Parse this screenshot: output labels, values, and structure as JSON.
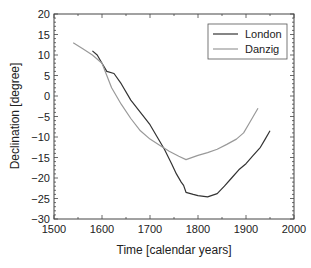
{
  "chart_data": {
    "type": "line",
    "title": "",
    "xlabel": "Time [calendar years]",
    "ylabel": "Declination [degree]",
    "xlim": [
      1500,
      2000
    ],
    "ylim": [
      -30,
      20
    ],
    "xticks": [
      1500,
      1600,
      1700,
      1800,
      1900,
      2000
    ],
    "yticks": [
      20,
      15,
      10,
      5,
      0,
      -5,
      -10,
      -15,
      -20,
      -25,
      -30
    ],
    "grid": false,
    "legend_position": "upper right",
    "series": [
      {
        "name": "London",
        "color": "#333333",
        "x": [
          1580,
          1590,
          1600,
          1610,
          1625,
          1640,
          1660,
          1680,
          1700,
          1715,
          1730,
          1745,
          1755,
          1765,
          1770,
          1775,
          1790,
          1800,
          1820,
          1840,
          1855,
          1870,
          1885,
          1900,
          1915,
          1930,
          1940,
          1950
        ],
        "y": [
          11,
          10,
          8,
          6,
          5.5,
          3,
          -1,
          -4,
          -7,
          -10,
          -13,
          -16.5,
          -19,
          -21,
          -21.8,
          -23.5,
          -24,
          -24.3,
          -24.6,
          -23.8,
          -22,
          -20,
          -18,
          -16.5,
          -14.5,
          -12.5,
          -10.5,
          -8.5
        ]
      },
      {
        "name": "Danzig",
        "color": "#999999",
        "x": [
          1540,
          1560,
          1580,
          1600,
          1610,
          1620,
          1630,
          1640,
          1660,
          1680,
          1700,
          1720,
          1740,
          1760,
          1775,
          1800,
          1820,
          1840,
          1860,
          1880,
          1895,
          1905,
          1915,
          1925
        ],
        "y": [
          13,
          11.5,
          10,
          8,
          5,
          2,
          0,
          -2,
          -5.5,
          -8.5,
          -10.5,
          -12,
          -13.5,
          -14.7,
          -15.5,
          -14.5,
          -13.8,
          -13,
          -11.8,
          -10.5,
          -9,
          -7,
          -5,
          -3
        ]
      }
    ]
  },
  "legend": {
    "items": [
      {
        "label": "London",
        "color": "#333333"
      },
      {
        "label": "Danzig",
        "color": "#999999"
      }
    ]
  }
}
